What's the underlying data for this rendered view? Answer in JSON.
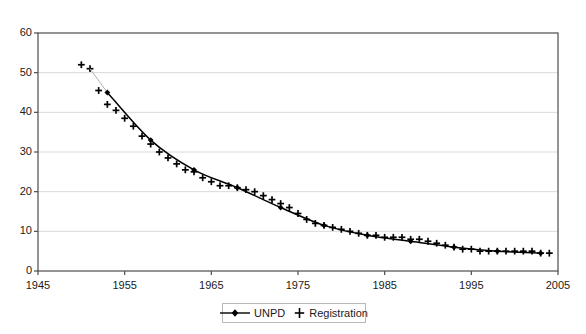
{
  "chart_data": {
    "type": "line",
    "title": "",
    "subtitle": "",
    "xlabel": "",
    "ylabel": "",
    "xlim": [
      1945,
      2005
    ],
    "ylim": [
      0,
      60
    ],
    "xticks": [
      1945,
      1955,
      1965,
      1975,
      1985,
      1995,
      2005
    ],
    "yticks": [
      0,
      10,
      20,
      30,
      40,
      50,
      60
    ],
    "grid": "horizontal",
    "legend_position": "bottom-center",
    "series": [
      {
        "name": "UNPD",
        "marker": "diamond",
        "line": "solid",
        "x": [
          1953,
          1958,
          1963,
          1968,
          1973,
          1978,
          1983,
          1988,
          1993,
          1998,
          2003
        ],
        "values": [
          45.0,
          33.0,
          25.5,
          21.0,
          16.0,
          11.5,
          9.0,
          7.5,
          6.0,
          5.0,
          4.5
        ]
      },
      {
        "name": "Registration",
        "marker": "plus",
        "line": "none",
        "x": [
          1950,
          1951,
          1952,
          1953,
          1954,
          1955,
          1956,
          1957,
          1958,
          1959,
          1960,
          1961,
          1962,
          1963,
          1964,
          1965,
          1966,
          1967,
          1968,
          1969,
          1970,
          1971,
          1972,
          1973,
          1974,
          1975,
          1976,
          1977,
          1978,
          1979,
          1980,
          1981,
          1982,
          1983,
          1984,
          1985,
          1986,
          1987,
          1988,
          1989,
          1990,
          1991,
          1992,
          1993,
          1994,
          1995,
          1996,
          1997,
          1998,
          1999,
          2000,
          2001,
          2002,
          2003,
          2004
        ],
        "values": [
          52.0,
          51.0,
          45.5,
          42.0,
          40.5,
          38.5,
          36.5,
          34.0,
          32.0,
          30.0,
          28.5,
          27.0,
          25.5,
          25.0,
          23.5,
          22.5,
          21.5,
          21.5,
          21.0,
          20.5,
          20.0,
          19.0,
          18.0,
          17.0,
          16.0,
          14.5,
          13.0,
          12.0,
          11.5,
          11.0,
          10.5,
          10.0,
          9.5,
          9.0,
          9.0,
          8.5,
          8.5,
          8.5,
          8.0,
          8.0,
          7.5,
          7.0,
          6.5,
          6.0,
          5.5,
          5.5,
          5.0,
          5.0,
          5.0,
          5.0,
          5.0,
          5.0,
          5.0,
          4.5,
          4.5
        ]
      }
    ]
  },
  "legend": {
    "entries": [
      {
        "label": "UNPD",
        "icon": "line-with-diamond-marker"
      },
      {
        "label": "Registration",
        "icon": "plus-marker"
      }
    ]
  },
  "axes": {
    "y_tick_labels": [
      "60",
      "50",
      "40",
      "30",
      "20",
      "10",
      "0"
    ],
    "x_tick_labels": [
      "1945",
      "1955",
      "1965",
      "1975",
      "1985",
      "1995",
      "2005"
    ]
  },
  "colors": {
    "series_line": "#000000",
    "marker": "#000000",
    "gridline": "#d9d9d9",
    "axis": "#4d4d4d",
    "background": "#ffffff",
    "legend_border": "#b9b9b9"
  }
}
